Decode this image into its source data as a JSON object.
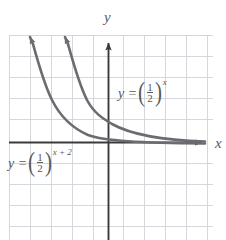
{
  "figure": {
    "type": "cartesian-graph",
    "background_color": "#ffffff",
    "grid": {
      "color": "#c9ccd4",
      "minor_color": "#dfe1e6",
      "spacing_px": 21,
      "left_px": 9,
      "top_px": 35,
      "right_px": 213,
      "bottom_px": 240,
      "visible": true
    },
    "axes": {
      "color": "#3a3a3c",
      "x_axis_label": "x",
      "y_axis_label": "y",
      "x_axis_y_px": 142,
      "y_axis_x_px": 108,
      "x_arrow": true,
      "y_arrow": true
    },
    "curves": [
      {
        "name": "curve-half-power-x",
        "color": "#6b6c70",
        "label": "y = (1/2)^x",
        "equation_parts": {
          "lead": "y =",
          "numerator": "1",
          "denominator": "2",
          "exponent": "x"
        },
        "y_intercept": 1,
        "passes_through": [
          [
            -3,
            8
          ],
          [
            -2,
            4
          ],
          [
            -1,
            2
          ],
          [
            0,
            1
          ],
          [
            1,
            0.5
          ],
          [
            2,
            0.25
          ],
          [
            3,
            0.125
          ]
        ],
        "arrow_end": "upper-left"
      },
      {
        "name": "curve-half-power-x-plus-2",
        "color": "#6b6c70",
        "label": "y = (1/2)^(x+2)",
        "equation_parts": {
          "lead": "y =",
          "numerator": "1",
          "denominator": "2",
          "exponent": "x + 2"
        },
        "y_intercept": 0.25,
        "passes_through": [
          [
            -5,
            8
          ],
          [
            -4,
            4
          ],
          [
            -3,
            2
          ],
          [
            -2,
            1
          ],
          [
            -1,
            0.5
          ],
          [
            0,
            0.25
          ],
          [
            1,
            0.125
          ]
        ],
        "arrow_end": "upper-left"
      }
    ],
    "labels": [
      {
        "name": "equation-label-1",
        "lead": "y =",
        "numerator": "1",
        "denominator": "2",
        "exponent": "x",
        "x_px": 118,
        "y_px": 82
      },
      {
        "name": "equation-label-2",
        "lead": "y =",
        "numerator": "1",
        "denominator": "2",
        "exponent": "x + 2",
        "x_px": 8,
        "y_px": 152
      }
    ]
  }
}
